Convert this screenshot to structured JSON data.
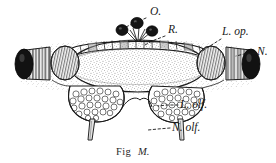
{
  "figure": {
    "caption_prefix": "Fig",
    "caption_id": "M.",
    "background_color": "#ffffff",
    "ink_color": "#1a1a1a",
    "stipple_color": "#4a4a4a",
    "width": 276,
    "height": 163
  },
  "labels": [
    {
      "key": "ocelli",
      "text": "O.",
      "x": 150,
      "y": 15,
      "leader": [
        [
          146,
          18
        ],
        [
          130,
          25
        ],
        [
          120,
          30
        ]
      ]
    },
    {
      "key": "rind",
      "text": "R.",
      "x": 168,
      "y": 33,
      "leader": [
        [
          165,
          36
        ],
        [
          152,
          41
        ],
        [
          145,
          45
        ]
      ]
    },
    {
      "key": "optic-lobe",
      "text": "L. op.",
      "x": 222,
      "y": 35,
      "leader": [
        [
          221,
          39
        ],
        [
          210,
          46
        ],
        [
          200,
          52
        ]
      ]
    },
    {
      "key": "optic-nerve",
      "text": "N.",
      "x": 257,
      "y": 55,
      "leader": [
        [
          255,
          52
        ],
        [
          244,
          53
        ],
        [
          234,
          55
        ]
      ]
    },
    {
      "key": "olfactory-lobe",
      "text": "L. olf.",
      "x": 180,
      "y": 108,
      "leader": [
        [
          178,
          105
        ],
        [
          167,
          105
        ],
        [
          158,
          106
        ]
      ]
    },
    {
      "key": "olfactory-nerve",
      "text": "N. olf.",
      "x": 172,
      "y": 131,
      "leader": [
        [
          170,
          128
        ],
        [
          158,
          129
        ],
        [
          148,
          130
        ]
      ]
    }
  ],
  "structures": {
    "ocelli_count": 3,
    "optic_nerve_count": 2,
    "olfactory_lobe_count": 2,
    "olfactory_nerve_count": 2,
    "rind_cell_count": 16
  }
}
